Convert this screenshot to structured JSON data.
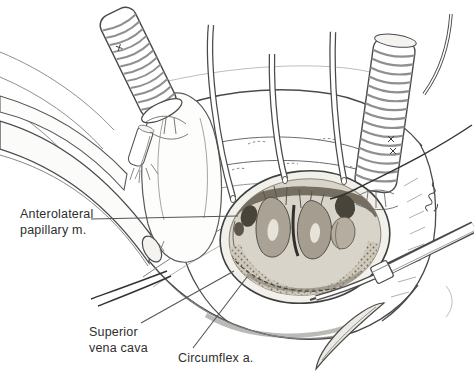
{
  "figure": {
    "labels": {
      "anterolateral": {
        "line1": "Anterolateral",
        "line2": "papillary m."
      },
      "superior_vena_cava": {
        "line1": "Superior",
        "line2": "vena cava"
      },
      "circumflex": {
        "line1": "Circumflex a."
      }
    },
    "colors": {
      "background": "#ffffff",
      "ink": "#3f3f3f",
      "ink_light": "#8f8f8f",
      "label_text": "#2e2e2e",
      "atrium_interior": "#d8d4ca",
      "papillary_muscle": "#a8a092",
      "cut_edge": "#f2f0ea"
    }
  }
}
